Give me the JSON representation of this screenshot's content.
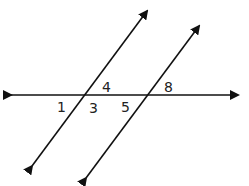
{
  "diagram": {
    "type": "parallel-lines-cut-by-transversal",
    "line_color": "#111111",
    "transversal": {
      "name": "horizontal-line",
      "y": 95
    },
    "parallel_lines": [
      {
        "name": "left-parallel-line",
        "top": [
          152,
          4
        ],
        "bottom": [
          26,
          174
        ],
        "intersection": [
          83,
          95
        ]
      },
      {
        "name": "right-parallel-line",
        "top": [
          204,
          19
        ],
        "bottom": [
          80,
          186
        ],
        "intersection": [
          147,
          95
        ]
      }
    ],
    "angle_labels": [
      {
        "id": "angle-1",
        "text": "1",
        "x": 57,
        "y": 112
      },
      {
        "id": "angle-3",
        "text": "3",
        "x": 89,
        "y": 113
      },
      {
        "id": "angle-4",
        "text": "4",
        "x": 102,
        "y": 92
      },
      {
        "id": "angle-5",
        "text": "5",
        "x": 121,
        "y": 112
      },
      {
        "id": "angle-8",
        "text": "8",
        "x": 164,
        "y": 92
      }
    ]
  }
}
